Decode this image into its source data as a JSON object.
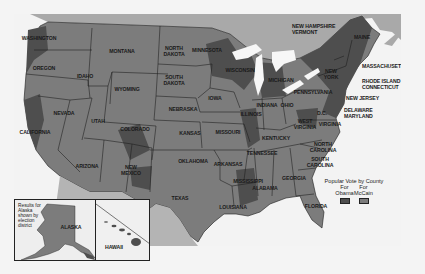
{
  "map": {
    "title_hidden": "2008 U.S. Presidential Election — Popular Vote by County",
    "colors": {
      "background": "#f4f4f4",
      "water": "#f3f3f3",
      "canada": "#a9a9a9",
      "mexico": "#b4b4b4",
      "obama": "#4e4e4e",
      "mccain": "#7c7c7c",
      "state_border": "#1b1b1b",
      "lakes": "#f7f7f7"
    },
    "states": [
      {
        "id": "washington",
        "label": "WASHINGTON",
        "x": 39,
        "y": 39
      },
      {
        "id": "oregon",
        "label": "OREGON",
        "x": 44,
        "y": 69
      },
      {
        "id": "california",
        "label": "CALIFORNIA",
        "x": 35,
        "y": 133
      },
      {
        "id": "nevada",
        "label": "NEVADA",
        "x": 64,
        "y": 114
      },
      {
        "id": "idaho",
        "label": "IDAHO",
        "x": 85,
        "y": 77
      },
      {
        "id": "montana",
        "label": "MONTANA",
        "x": 122,
        "y": 52
      },
      {
        "id": "wyoming",
        "label": "WYOMING",
        "x": 127,
        "y": 90
      },
      {
        "id": "utah",
        "label": "UTAH",
        "x": 98,
        "y": 122
      },
      {
        "id": "colorado",
        "label": "COLORADO",
        "x": 135,
        "y": 130
      },
      {
        "id": "arizona",
        "label": "ARIZONA",
        "x": 87,
        "y": 167
      },
      {
        "id": "new-mexico",
        "label": "NEW\nMEXICO",
        "x": 131,
        "y": 170
      },
      {
        "id": "north-dakota",
        "label": "NORTH\nDAKOTA",
        "x": 174,
        "y": 51
      },
      {
        "id": "south-dakota",
        "label": "SOUTH\nDAKOTA",
        "x": 174,
        "y": 80
      },
      {
        "id": "nebraska",
        "label": "NEBRASKA",
        "x": 183,
        "y": 110
      },
      {
        "id": "kansas",
        "label": "KANSAS",
        "x": 190,
        "y": 134
      },
      {
        "id": "oklahoma",
        "label": "OKLAHOMA",
        "x": 193,
        "y": 162
      },
      {
        "id": "texas",
        "label": "TEXAS",
        "x": 180,
        "y": 199
      },
      {
        "id": "minnesota",
        "label": "MINNESOTA",
        "x": 207,
        "y": 51
      },
      {
        "id": "iowa",
        "label": "IOWA",
        "x": 215,
        "y": 99
      },
      {
        "id": "missouri",
        "label": "MISSOURI",
        "x": 228,
        "y": 133
      },
      {
        "id": "arkansas",
        "label": "ARKANSAS",
        "x": 228,
        "y": 165
      },
      {
        "id": "louisiana",
        "label": "LOUISIANA",
        "x": 233,
        "y": 208
      },
      {
        "id": "wisconsin",
        "label": "WISCONSIN",
        "x": 240,
        "y": 71
      },
      {
        "id": "illinois",
        "label": "ILLINOIS",
        "x": 251,
        "y": 115
      },
      {
        "id": "michigan",
        "label": "MICHIGAN",
        "x": 281,
        "y": 81
      },
      {
        "id": "indiana",
        "label": "INDIANA",
        "x": 267,
        "y": 106
      },
      {
        "id": "ohio",
        "label": "OHIO",
        "x": 287,
        "y": 106
      },
      {
        "id": "kentucky",
        "label": "KENTUCKY",
        "x": 276,
        "y": 139
      },
      {
        "id": "tennessee",
        "label": "TENNESSEE",
        "x": 262,
        "y": 154
      },
      {
        "id": "mississippi",
        "label": "MISSISSIPPI",
        "x": 248,
        "y": 182
      },
      {
        "id": "alabama",
        "label": "ALABAMA",
        "x": 265,
        "y": 189
      },
      {
        "id": "georgia",
        "label": "GEORGIA",
        "x": 294,
        "y": 179
      },
      {
        "id": "florida",
        "label": "FLORIDA",
        "x": 316,
        "y": 207
      },
      {
        "id": "south-carolina",
        "label": "SOUTH\nCAROLINA",
        "x": 320,
        "y": 162
      },
      {
        "id": "north-carolina",
        "label": "NORTH\nCAROLINA",
        "x": 323,
        "y": 147
      },
      {
        "id": "virginia",
        "label": "VIRGINIA",
        "x": 330,
        "y": 125
      },
      {
        "id": "west-virginia",
        "label": "WEST\nVIRGINIA",
        "x": 305,
        "y": 124
      },
      {
        "id": "dc",
        "label": "D.C.",
        "x": 322,
        "y": 114
      },
      {
        "id": "pennsylvania",
        "label": "PENNSYLVANIA",
        "x": 313,
        "y": 93
      },
      {
        "id": "new-york",
        "label": "NEW\nYORK",
        "x": 331,
        "y": 74
      },
      {
        "id": "maine",
        "label": "MAINE",
        "x": 362,
        "y": 38
      }
    ],
    "callouts": [
      {
        "id": "new-hampshire-vermont",
        "label": "NEW HAMPSHIRE\nVERMONT",
        "x": 292,
        "y": 29
      },
      {
        "id": "massachusetts",
        "label": "MASSACHUSETTS",
        "x": 362,
        "y": 67
      },
      {
        "id": "rhode-island-connecticut",
        "label": "RHODE ISLAND\nCONNECTICUT",
        "x": 362,
        "y": 84
      },
      {
        "id": "new-jersey",
        "label": "NEW JERSEY",
        "x": 346,
        "y": 99
      },
      {
        "id": "delaware-maryland",
        "label": "DELAWARE\nMARYLAND",
        "x": 344,
        "y": 113
      }
    ],
    "insets": {
      "alaska": {
        "label": "ALASKA",
        "note": "Results for\nAlaska\nshown by\nelection\ndistrict"
      },
      "hawaii": {
        "label": "HAWAII"
      }
    },
    "legend": {
      "title": "Popular Vote by County",
      "items": [
        {
          "line1": "For",
          "line2": "Obama",
          "color": "#4e4e4e"
        },
        {
          "line1": "For",
          "line2": "McCain",
          "color": "#7c7c7c"
        }
      ]
    }
  }
}
